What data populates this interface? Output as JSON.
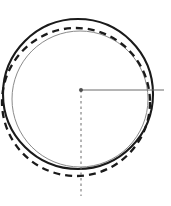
{
  "canvas": {
    "width": 171,
    "height": 206,
    "background": "#ffffff",
    "title": "Circle tolerance / roundness deviation diagram"
  },
  "chart_data": {
    "type": "diagram",
    "title": "",
    "subtitle": "",
    "xlabel": "",
    "ylabel": "",
    "grid": false,
    "legend": null,
    "elements": [
      {
        "name": "nominal-circle",
        "shape": "circle",
        "style": "solid",
        "cx": 80,
        "cy": 99,
        "r": 68,
        "stroke": "#8a8a8a",
        "stroke_width": 1.0
      },
      {
        "name": "actual-circle",
        "shape": "circle",
        "style": "solid",
        "cx": 78,
        "cy": 94,
        "r": 75,
        "stroke": "#1a1a1a",
        "stroke_width": 2.1
      },
      {
        "name": "tolerance-circle",
        "shape": "circle",
        "style": "dashed",
        "cx": 76,
        "cy": 102,
        "r": 74,
        "stroke": "#1a1a1a",
        "stroke_width": 2.3,
        "dash_pattern": "7 5"
      },
      {
        "name": "center-point",
        "shape": "point",
        "cx": 81,
        "cy": 90,
        "r": 1.7,
        "stroke": "#555555",
        "fill": "#4d4d4d"
      },
      {
        "name": "radius-line",
        "shape": "line",
        "style": "solid",
        "x1": 81,
        "y1": 90,
        "x2": 164,
        "y2": 90,
        "stroke": "#6b6b6b",
        "stroke_width": 1.0
      },
      {
        "name": "vertical-center-line",
        "shape": "line",
        "style": "dashed",
        "x1": 81,
        "y1": 90,
        "x2": 81,
        "y2": 196,
        "stroke": "#6b6b6b",
        "stroke_width": 1.0,
        "dash_pattern": "2.5 3"
      }
    ],
    "annotations": [],
    "colors": {
      "ink": "#1a1a1a",
      "light_ink": "#8a8a8a",
      "thin_line": "#6b6b6b",
      "background": "#ffffff"
    }
  }
}
